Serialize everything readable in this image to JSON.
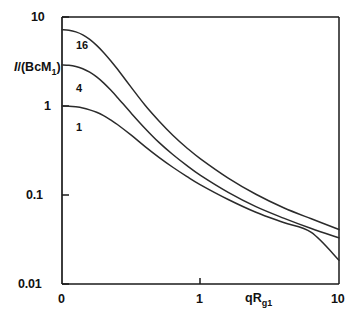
{
  "chart_data": {
    "type": "line",
    "title": "",
    "xlabel": "qRg1",
    "ylabel": "I/(BcM1)",
    "xscale": "linear",
    "yscale": "log",
    "xlim": [
      0,
      10
    ],
    "ylim": [
      0.01,
      10
    ],
    "grid": false,
    "legend": "inline-curve-labels",
    "x_ticks": [
      "0",
      "1",
      "10"
    ],
    "x_tick_values": [
      0,
      1,
      10
    ],
    "y_ticks": [
      "10",
      "1",
      "0.1",
      "0.01"
    ],
    "y_tick_values": [
      10,
      1,
      0.1,
      0.01
    ],
    "series": [
      {
        "name": "16",
        "label": "16",
        "x": [
          0,
          0.25,
          0.5,
          0.75,
          1.0,
          1.25,
          1.5,
          1.75,
          2.0,
          2.5,
          3.0,
          3.5,
          4.0,
          4.5,
          5.0,
          6.0,
          7.0,
          8.0,
          9.0,
          10.0
        ],
        "y": [
          7.2,
          7.1,
          6.8,
          6.3,
          5.6,
          4.8,
          4.0,
          3.25,
          2.6,
          1.62,
          1.02,
          0.68,
          0.47,
          0.34,
          0.255,
          0.155,
          0.102,
          0.072,
          0.054,
          0.041
        ]
      },
      {
        "name": "4",
        "label": "4",
        "x": [
          0,
          0.25,
          0.5,
          0.75,
          1.0,
          1.25,
          1.5,
          1.75,
          2.0,
          2.5,
          3.0,
          3.5,
          4.0,
          4.5,
          5.0,
          6.0,
          7.0,
          8.0,
          9.0,
          10.0
        ],
        "y": [
          2.9,
          2.87,
          2.78,
          2.62,
          2.4,
          2.12,
          1.82,
          1.52,
          1.25,
          0.83,
          0.56,
          0.39,
          0.285,
          0.215,
          0.166,
          0.107,
          0.074,
          0.055,
          0.042,
          0.033
        ]
      },
      {
        "name": "1",
        "label": "1",
        "x": [
          0,
          0.25,
          0.5,
          0.75,
          1.0,
          1.25,
          1.5,
          1.75,
          2.0,
          2.5,
          3.0,
          3.5,
          4.0,
          4.5,
          5.0,
          6.0,
          7.0,
          8.0,
          9.0,
          10.0
        ],
        "y": [
          1.0,
          0.995,
          0.978,
          0.95,
          0.905,
          0.85,
          0.78,
          0.7,
          0.62,
          0.47,
          0.35,
          0.265,
          0.205,
          0.162,
          0.13,
          0.089,
          0.064,
          0.049,
          0.038,
          0.0185
        ]
      }
    ],
    "curve_label_positions": [
      {
        "label": "16",
        "x_px": 76,
        "y_px": 46
      },
      {
        "label": "4",
        "x_px": 76,
        "y_px": 89
      },
      {
        "label": "1",
        "x_px": 76,
        "y_px": 128
      }
    ],
    "axis_color": "#1a1a1a",
    "curve_color": "#2b2b2b",
    "background": "#ffffff"
  },
  "axis": {
    "y_label_main": "I",
    "y_label_rest": "/(BcM",
    "y_label_sub": "1",
    "y_label_close": ")",
    "x_label_q": "qR",
    "x_label_sub": "g1"
  },
  "ticks": {
    "y": [
      "10",
      "1",
      "0.1",
      "0.01"
    ],
    "x": [
      "0",
      "1",
      "10"
    ]
  },
  "curves": {
    "top": "16",
    "middle": "4",
    "bottom": "1"
  }
}
